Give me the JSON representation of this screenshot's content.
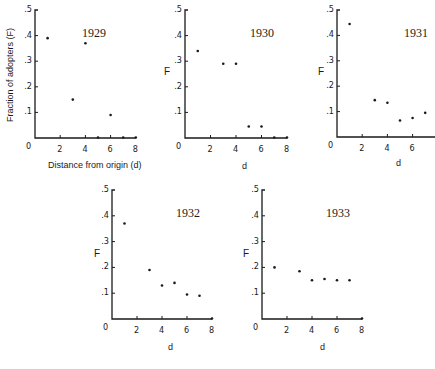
{
  "chart_data": [
    {
      "type": "scatter",
      "title": "1929",
      "xlabel": "Distance from origin  (d)",
      "ylabel": "Fraction of adopters  (F)",
      "xticks": [
        "0",
        "2",
        "4",
        "6",
        "8"
      ],
      "yticks": [
        ".1",
        ".2",
        ".3",
        ".4",
        ".5"
      ],
      "xlim": [
        0,
        8
      ],
      "ylim": [
        0,
        0.5
      ],
      "grid": false,
      "x": [
        1,
        3,
        4,
        5,
        6,
        7,
        8
      ],
      "y": [
        0.39,
        0.15,
        0.37,
        0.0,
        0.09,
        0.0,
        0.0
      ]
    },
    {
      "type": "scatter",
      "title": "1930",
      "xlabel": "d",
      "ylabel": "F",
      "xticks": [
        "0",
        "2",
        "4",
        "6",
        "8"
      ],
      "yticks": [
        ".1",
        ".2",
        ".3",
        ".4",
        ".5"
      ],
      "xlim": [
        0,
        8
      ],
      "ylim": [
        0,
        0.5
      ],
      "grid": false,
      "x": [
        1,
        3,
        4,
        5,
        6,
        7,
        8
      ],
      "y": [
        0.34,
        0.29,
        0.29,
        0.045,
        0.045,
        0.0,
        0.0
      ]
    },
    {
      "type": "scatter",
      "title": "1931",
      "xlabel": "d",
      "ylabel": "F",
      "xticks": [
        "0",
        "2",
        "4",
        "6"
      ],
      "yticks": [
        ".1",
        ".2",
        ".3",
        ".4",
        ".5"
      ],
      "xlim": [
        0,
        8
      ],
      "ylim": [
        0,
        0.5
      ],
      "grid": false,
      "x": [
        1,
        3,
        4,
        5,
        6,
        7
      ],
      "y": [
        0.445,
        0.145,
        0.135,
        0.065,
        0.075,
        0.095
      ]
    },
    {
      "type": "scatter",
      "title": "1932",
      "xlabel": "d",
      "ylabel": "F",
      "xticks": [
        "0",
        "2",
        "4",
        "6",
        "8"
      ],
      "yticks": [
        ".1",
        ".2",
        ".3",
        ".4",
        ".5"
      ],
      "xlim": [
        0,
        8
      ],
      "ylim": [
        0,
        0.5
      ],
      "grid": false,
      "x": [
        1,
        3,
        4,
        5,
        6,
        7,
        8
      ],
      "y": [
        0.37,
        0.19,
        0.13,
        0.14,
        0.095,
        0.09,
        0.0
      ]
    },
    {
      "type": "scatter",
      "title": "1933",
      "xlabel": "d",
      "ylabel": "F",
      "xticks": [
        "0",
        "2",
        "4",
        "6",
        "8"
      ],
      "yticks": [
        ".1",
        ".2",
        ".3",
        ".4",
        ".5"
      ],
      "xlim": [
        0,
        8
      ],
      "ylim": [
        0,
        0.5
      ],
      "grid": false,
      "x": [
        1,
        3,
        4,
        5,
        6,
        7,
        8
      ],
      "y": [
        0.2,
        0.185,
        0.15,
        0.155,
        0.15,
        0.15,
        0.0
      ]
    }
  ],
  "panels": [
    {
      "year": "1929",
      "xlabel": "Distance from origin  (d)",
      "ylabel": "Fraction of adopters  (F)",
      "origin": "0"
    },
    {
      "year": "1930",
      "xlabel": "d",
      "ylabel": "F",
      "origin": "0"
    },
    {
      "year": "1931",
      "xlabel": "d",
      "ylabel": "F",
      "origin": "0"
    },
    {
      "year": "1932",
      "xlabel": "d",
      "ylabel": "F",
      "origin": "0"
    },
    {
      "year": "1933",
      "xlabel": "d",
      "ylabel": "F",
      "origin": "0"
    }
  ]
}
